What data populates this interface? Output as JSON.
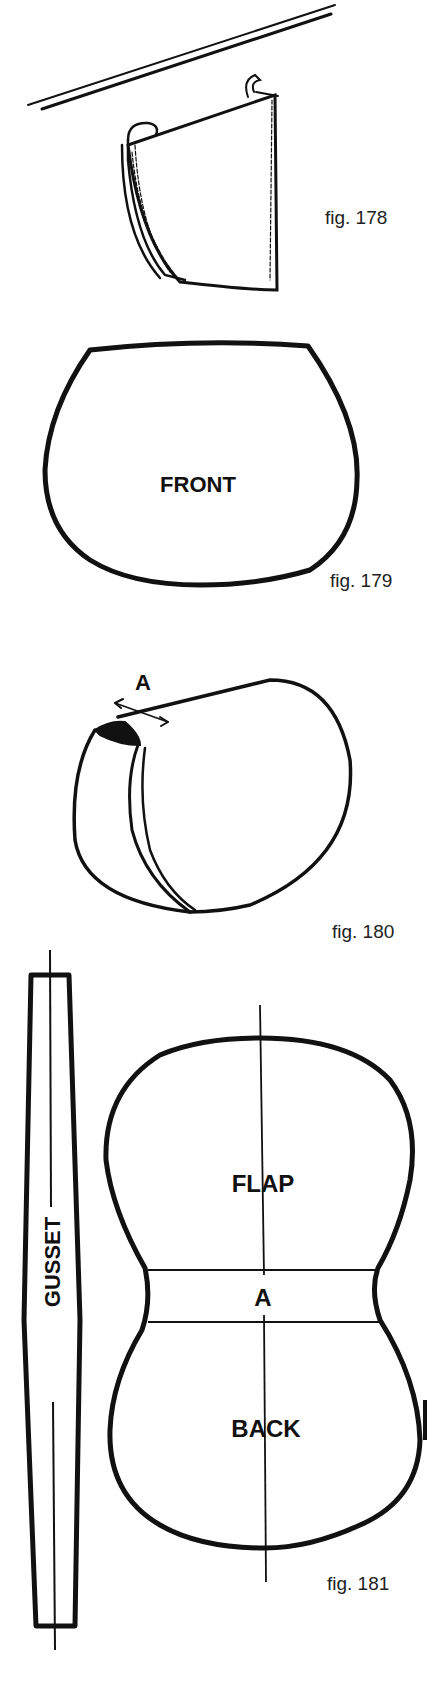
{
  "figures": [
    {
      "id": "fig-178",
      "caption": "fig. 178"
    },
    {
      "id": "fig-179",
      "caption": "fig. 179",
      "label": "FRONT"
    },
    {
      "id": "fig-180",
      "caption": "fig. 180",
      "label": "A"
    },
    {
      "id": "fig-181",
      "caption": "fig. 181",
      "labels": {
        "flap": "FLAP",
        "a": "A",
        "back": "BACK",
        "gusset": "GUSSET"
      }
    }
  ],
  "colors": {
    "ink": "#111111",
    "paper": "#ffffff"
  }
}
